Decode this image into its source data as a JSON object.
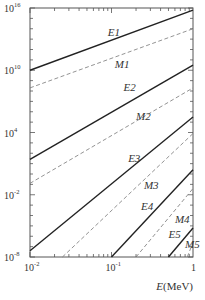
{
  "chart_data": {
    "type": "line",
    "title": "",
    "xlabel": "E(MeV)",
    "ylabel": "",
    "xscale": "log",
    "yscale": "log",
    "xlim": [
      0.01,
      1
    ],
    "ylim": [
      1e-08,
      1e+16
    ],
    "x_ticks": [
      {
        "value": 0.01,
        "label": "10",
        "exp": "-2"
      },
      {
        "value": 0.1,
        "label": "10",
        "exp": "-1"
      },
      {
        "value": 1,
        "label": "1",
        "exp": ""
      }
    ],
    "y_ticks": [
      {
        "value": 1e-08,
        "label": "10",
        "exp": "-8"
      },
      {
        "value": 0.01,
        "label": "10",
        "exp": "-2"
      },
      {
        "value": 10000.0,
        "label": "10",
        "exp": "4"
      },
      {
        "value": 10000000000.0,
        "label": "10",
        "exp": "10"
      },
      {
        "value": 1e+16,
        "label": "10",
        "exp": "16"
      }
    ],
    "grid": false,
    "legend": "inline labels",
    "series": [
      {
        "name": "E1",
        "style": "solid",
        "x": [
          0.01,
          1
        ],
        "log10_y": [
          10.0,
          15.8
        ],
        "label_pos": [
          0.09,
          13.3
        ]
      },
      {
        "name": "M1",
        "style": "dashed",
        "x": [
          0.01,
          1
        ],
        "log10_y": [
          8.3,
          14.0
        ],
        "label_pos": [
          0.11,
          10.2
        ]
      },
      {
        "name": "E2",
        "style": "solid",
        "x": [
          0.01,
          1
        ],
        "log10_y": [
          1.4,
          10.5
        ],
        "label_pos": [
          0.14,
          8.0
        ]
      },
      {
        "name": "M2",
        "style": "dashed",
        "x": [
          0.01,
          1
        ],
        "log10_y": [
          -0.9,
          8.3
        ],
        "label_pos": [
          0.2,
          5.2
        ]
      },
      {
        "name": "E3",
        "style": "solid",
        "x": [
          0.01,
          1
        ],
        "log10_y": [
          -7.4,
          5.5
        ],
        "label_pos": [
          0.16,
          1.2
        ]
      },
      {
        "name": "M3",
        "style": "dashed",
        "x": [
          0.025,
          1
        ],
        "log10_y": [
          -8.0,
          3.9
        ],
        "label_pos": [
          0.25,
          -1.4
        ]
      },
      {
        "name": "E4",
        "style": "solid",
        "x": [
          0.1,
          1
        ],
        "log10_y": [
          -8.0,
          0.4
        ],
        "label_pos": [
          0.23,
          -3.5
        ]
      },
      {
        "name": "M4",
        "style": "dashed",
        "x": [
          0.2,
          1
        ],
        "log10_y": [
          -8.0,
          -1.4
        ],
        "label_pos": [
          0.6,
          -4.7
        ]
      },
      {
        "name": "E5",
        "style": "solid",
        "x": [
          0.5,
          1
        ],
        "log10_y": [
          -8.0,
          -5.2
        ],
        "label_pos": [
          0.5,
          -6.2
        ]
      },
      {
        "name": "M5",
        "style": "dashed",
        "x": [
          0.85,
          1
        ],
        "log10_y": [
          -8.0,
          -6.6
        ],
        "label_pos": [
          0.8,
          -7.1
        ]
      }
    ]
  }
}
